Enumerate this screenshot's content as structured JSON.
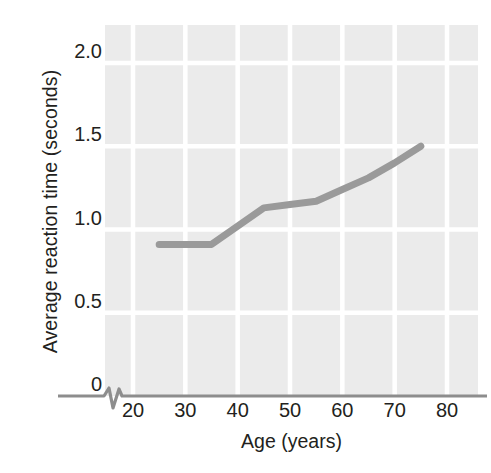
{
  "figure": {
    "background_color": "#ffffff",
    "panel_color": "#ebebeb",
    "gridline_color": "#ffffff",
    "axis_color": "#8d8d8d",
    "line_color": "#9a9a9a",
    "text_color": "#231f20"
  },
  "chart_data": {
    "type": "line",
    "title": "",
    "subtitle": "",
    "xlabel": "Age (years)",
    "ylabel": "Average reaction time (seconds)",
    "xlim": [
      15,
      85
    ],
    "ylim": [
      0,
      2.15
    ],
    "xticks": [
      20,
      30,
      40,
      50,
      60,
      70,
      80
    ],
    "xtick_labels": [
      "20",
      "30",
      "40",
      "50",
      "60",
      "70",
      "80"
    ],
    "yticks": [
      0,
      0.5,
      1.0,
      1.5,
      2.0
    ],
    "ytick_labels": [
      "0",
      "0.5",
      "1.0",
      "1.5",
      "2.0"
    ],
    "grid": true,
    "grid_axis": "both",
    "legend": false,
    "legend_position": "none",
    "axis_break": {
      "axis": "x",
      "shape": "zigzag",
      "between": [
        15,
        18
      ]
    },
    "series": [
      {
        "name": "Average reaction time",
        "color": "#9a9a9a",
        "linewidth": 7,
        "markers": false,
        "x": [
          25,
          30,
          35,
          40,
          45,
          50,
          55,
          60,
          65,
          70,
          75
        ],
        "values": [
          0.91,
          0.91,
          0.91,
          1.02,
          1.13,
          1.15,
          1.17,
          1.24,
          1.31,
          1.4,
          1.5
        ]
      }
    ]
  },
  "axis": {
    "y_title": "Average reaction time (seconds)",
    "x_title": "Age (years)"
  }
}
